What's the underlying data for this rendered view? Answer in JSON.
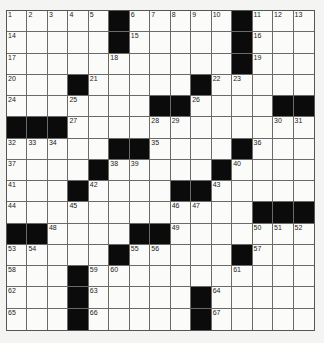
{
  "puzzle": {
    "rows": 15,
    "cols": 15,
    "colors": {
      "black": "#0b0b0b",
      "white": "#fbfbf9",
      "line": "#6a6a6a"
    },
    "grid": [
      [
        "1",
        "2",
        "3",
        "4",
        "5",
        "#",
        "6",
        "7",
        "8",
        "9",
        "10",
        "#",
        "11",
        "12",
        "13"
      ],
      [
        "14",
        ".",
        ".",
        ".",
        ".",
        "#",
        "15",
        ".",
        ".",
        ".",
        ".",
        "#",
        "16",
        ".",
        "."
      ],
      [
        "17",
        ".",
        ".",
        ".",
        ".",
        "18",
        ".",
        ".",
        ".",
        ".",
        ".",
        "#",
        "19",
        ".",
        "."
      ],
      [
        "20",
        ".",
        ".",
        "#",
        "21",
        ".",
        ".",
        ".",
        ".",
        "#",
        "22",
        "23",
        ".",
        ".",
        "."
      ],
      [
        "24",
        ".",
        ".",
        "25",
        ".",
        ".",
        ".",
        "#",
        "#",
        "26",
        ".",
        ".",
        ".",
        "#",
        "#"
      ],
      [
        "#",
        "#",
        "#",
        "27",
        ".",
        ".",
        ".",
        "28",
        "29",
        ".",
        ".",
        ".",
        ".",
        "30",
        "31"
      ],
      [
        "32",
        "33",
        "34",
        ".",
        ".",
        "#",
        "#",
        "35",
        ".",
        ".",
        ".",
        "#",
        "36",
        ".",
        "."
      ],
      [
        "37",
        ".",
        ".",
        ".",
        "#",
        "38",
        "39",
        ".",
        ".",
        ".",
        "#",
        "40",
        ".",
        ".",
        "."
      ],
      [
        "41",
        ".",
        ".",
        "#",
        "42",
        ".",
        ".",
        ".",
        "#",
        "#",
        "43",
        ".",
        ".",
        ".",
        "."
      ],
      [
        "44",
        ".",
        ".",
        "45",
        ".",
        ".",
        ".",
        ".",
        "46",
        "47",
        ".",
        ".",
        "#",
        "#",
        "#"
      ],
      [
        "#",
        "#",
        "48",
        ".",
        ".",
        ".",
        "#",
        "#",
        "49",
        ".",
        ".",
        ".",
        "50",
        "51",
        "52"
      ],
      [
        "53",
        "54",
        ".",
        ".",
        ".",
        "#",
        "55",
        "56",
        ".",
        ".",
        ".",
        "#",
        "57",
        ".",
        "."
      ],
      [
        "58",
        ".",
        ".",
        "#",
        "59",
        "60",
        ".",
        ".",
        ".",
        ".",
        ".",
        "61",
        ".",
        ".",
        "."
      ],
      [
        "62",
        ".",
        ".",
        "#",
        "63",
        ".",
        ".",
        ".",
        ".",
        "#",
        "64",
        ".",
        ".",
        ".",
        "."
      ],
      [
        "65",
        ".",
        ".",
        "#",
        "66",
        ".",
        ".",
        ".",
        ".",
        "#",
        "67",
        ".",
        ".",
        ".",
        "."
      ]
    ]
  }
}
